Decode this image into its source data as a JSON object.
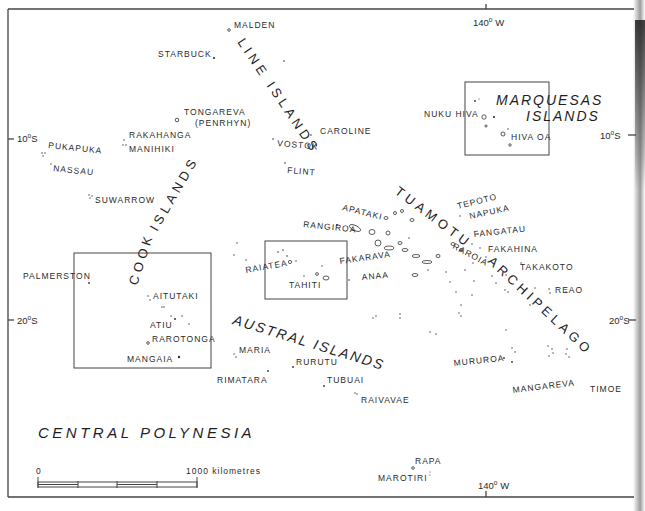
{
  "map": {
    "title": "CENTRAL POLYNESIA",
    "graticule": {
      "lon_140w_top": "140",
      "lon_140w_bottom": "140",
      "lon_unit": "W",
      "lat_10s_left": "10",
      "lat_10s_right": "10",
      "lat_20s_left": "20",
      "lat_20s_right": "20",
      "lat_unit": "S",
      "degree": "o"
    },
    "scale_bar": {
      "start_label": "0",
      "end_label": "1000 kilometres"
    },
    "island_groups": [
      {
        "name": "LINE ISLANDS"
      },
      {
        "name": "COOK ISLANDS",
        "part1": "COOK",
        "part2": "ISLANDS"
      },
      {
        "name": "MARQUESAS ISLANDS",
        "part1": "MARQUESAS",
        "part2": "ISLANDS"
      },
      {
        "name": "TUAMOTU ARCHIPELAGO",
        "part1": "TUAMOTU",
        "part2": "ARCHIPELAGO"
      },
      {
        "name": "AUSTRAL ISLANDS"
      }
    ],
    "islands": {
      "malden": "MALDEN",
      "starbuck": "STARBUCK",
      "tongareva": "TONGAREVA",
      "penrhyn": "(PENRHYN)",
      "caroline": "CAROLINE",
      "vostok": "VOSTOK",
      "flint": "FLINT",
      "rakahanga": "RAKAHANGA",
      "manihiki": "MANIHIKI",
      "pukapuka": "PUKAPUKA",
      "nassau": "NASSAU",
      "suwarrow": "SUWARROW",
      "nuku_hiva": "NUKU HIVA",
      "hiva_oa": "HIVA OA",
      "tepoto": "TEPOTO",
      "napuka": "NAPUKA",
      "fangatau": "FANGATAU",
      "fakahina": "FAKAHINA",
      "takakoto": "TAKAKOTO",
      "reao": "REAO",
      "apataki": "APATAKI",
      "rangiroa": "RANGIROA",
      "raroia": "RAROIA",
      "fakarava": "FAKARAVA",
      "anaa": "ANAA",
      "raiatea": "RAIATEA",
      "tahiti": "TAHITI",
      "palmerston": "PALMERSTON",
      "aitutaki": "AITUTAKI",
      "atiu": "ATIU",
      "rarotonga": "RAROTONGA",
      "mangaia": "MANGAIA",
      "maria": "MARIA",
      "rimatara": "RIMATARA",
      "rurutu": "RURUTU",
      "tubuai": "TUBUAI",
      "raivavae": "RAIVAVAE",
      "mururoa": "MURUROA",
      "mangareva": "MANGAREVA",
      "timoe": "TIMOE",
      "rapa": "RAPA",
      "marotiri": "MAROTIRI"
    },
    "colors": {
      "ink": "#2a2a2a",
      "paper": "#ffffff",
      "frame": "#444444"
    }
  }
}
